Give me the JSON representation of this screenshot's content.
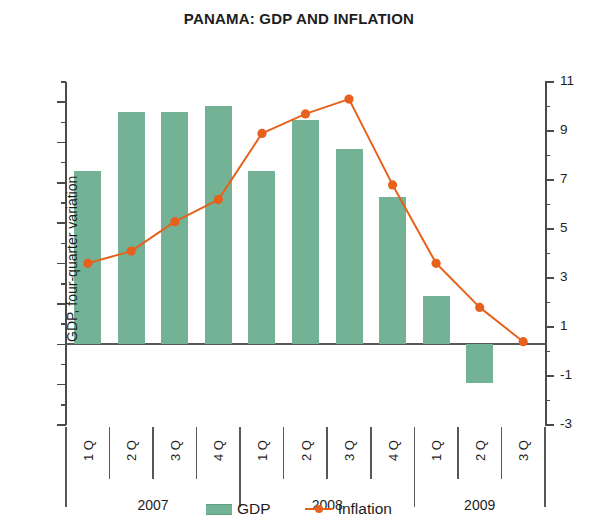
{
  "chart_data": {
    "type": "bar",
    "title": "PANAMA: GDP AND INFLATION",
    "xlabel": "",
    "categories": [
      "1 Q",
      "2 Q",
      "3 Q",
      "4 Q",
      "1 Q",
      "2 Q",
      "3 Q",
      "4 Q",
      "1 Q",
      "2 Q",
      "3 Q"
    ],
    "year_groups": [
      {
        "label": "2007",
        "quarters": [
          "1 Q",
          "2 Q",
          "3 Q",
          "4 Q"
        ]
      },
      {
        "label": "2008",
        "quarters": [
          "1 Q",
          "2 Q",
          "3 Q",
          "4 Q"
        ]
      },
      {
        "label": "2009",
        "quarters": [
          "1 Q",
          "2 Q",
          "3 Q"
        ]
      }
    ],
    "series": [
      {
        "name": "GDP",
        "type": "bar",
        "axis": "left",
        "color": "#74b295",
        "values": [
          8.6,
          11.5,
          11.5,
          11.8,
          8.6,
          11.1,
          9.7,
          7.3,
          2.4,
          -1.9,
          null
        ]
      },
      {
        "name": "Inflation",
        "type": "line",
        "axis": "right",
        "color": "#e8611c",
        "values": [
          3.6,
          4.1,
          5.3,
          6.2,
          8.9,
          9.7,
          10.3,
          6.8,
          3.6,
          1.8,
          0.4
        ]
      }
    ],
    "left_axis": {
      "label": "GDP, four-quarter variation",
      "ylim": [
        -4,
        13
      ],
      "ticks": [
        12,
        10,
        8,
        6,
        4,
        2,
        0,
        -2,
        -4
      ],
      "tick_labels": [
        "12",
        "10",
        "8",
        "6",
        "4",
        "2",
        "0",
        "-2",
        "-4"
      ],
      "minor_step": 1
    },
    "right_axis": {
      "label": "Inflation, 12-month variation",
      "ylim": [
        -3,
        11
      ],
      "ticks": [
        11,
        9,
        7,
        5,
        3,
        1,
        -1,
        -3
      ],
      "tick_labels": [
        "11",
        "9",
        "7",
        "5",
        "3",
        "1",
        "-1",
        "-3"
      ],
      "minor_step": 1
    },
    "grid": false,
    "legend_position": "bottom",
    "legend": [
      "GDP",
      "Inflation"
    ]
  },
  "legend": {
    "items": [
      {
        "label": "GDP",
        "icon": "bar-swatch-icon",
        "color": "#74b295"
      },
      {
        "label": "Inflation",
        "icon": "line-marker-swatch-icon",
        "color": "#e8611c"
      }
    ]
  }
}
